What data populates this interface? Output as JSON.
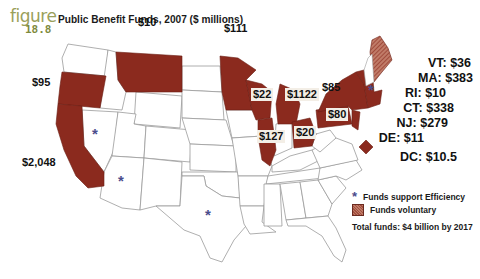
{
  "figure": {
    "word": "figure",
    "number": "18.8"
  },
  "title": "Public Benefit Funds, 2007 ($ millions)",
  "colors": {
    "funds_voluntary": "#8b2a1e",
    "hatched": "#b5604e",
    "star": "#4b4d8c",
    "state_border": "#9a9a9a",
    "figure_label": "#9aa05a"
  },
  "map_labels": [
    {
      "state": "WA/OR",
      "value": "$95"
    },
    {
      "state": "MT",
      "value": "$10"
    },
    {
      "state": "MN",
      "value": "$111"
    },
    {
      "state": "WI",
      "value": "$22"
    },
    {
      "state": "MI",
      "value": "$1122"
    },
    {
      "state": "NY",
      "value": "$85"
    },
    {
      "state": "PA",
      "value": "$80"
    },
    {
      "state": "OH",
      "value": "$20"
    },
    {
      "state": "IL",
      "value": "$127"
    },
    {
      "state": "CA",
      "value": "$2,048"
    }
  ],
  "northeast_list": [
    {
      "state": "VT",
      "value": "$36",
      "text": "VT:  $36"
    },
    {
      "state": "MA",
      "value": "$383",
      "text": "MA:  $383"
    },
    {
      "state": "RI",
      "value": "$10",
      "text": "RI:  $10"
    },
    {
      "state": "CT",
      "value": "$338",
      "text": "CT:  $338"
    },
    {
      "state": "NJ",
      "value": "$279",
      "text": "NJ:  $279"
    },
    {
      "state": "DE",
      "value": "$11",
      "text": "DE:  $11"
    },
    {
      "state": "DC",
      "value": "$10.5",
      "text": "DC:  $10.5"
    }
  ],
  "efficiency_star_states": [
    "NV",
    "AZ",
    "TX",
    "NH"
  ],
  "legend": {
    "items": [
      {
        "icon": "star-icon",
        "symbol": "*",
        "label": "Funds support Efficiency"
      },
      {
        "icon": "hatched-swatch",
        "label": "Funds voluntary"
      }
    ],
    "total": "Total funds: $4 billion by 2017"
  }
}
